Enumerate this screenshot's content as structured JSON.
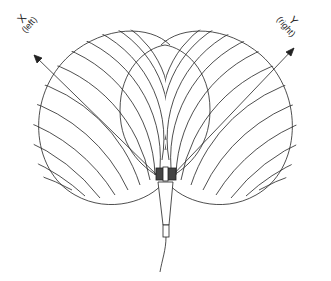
{
  "diagram": {
    "title": "",
    "axes": [
      {
        "id": "x",
        "label": "X",
        "sublabel": "(left)"
      },
      {
        "id": "y",
        "label": "Y",
        "sublabel": "(right)"
      }
    ],
    "elements": [
      "left cardioid pickup pattern",
      "right cardioid pickup pattern",
      "overlap region (cross-hatched)",
      "coincident stereo microphone pair with cable"
    ],
    "colors": {
      "line": "#222222",
      "background": "#ffffff"
    }
  }
}
